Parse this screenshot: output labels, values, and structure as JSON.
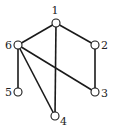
{
  "graph": {
    "nodes": [
      {
        "id": "1",
        "label": "1"
      },
      {
        "id": "2",
        "label": "2"
      },
      {
        "id": "3",
        "label": "3"
      },
      {
        "id": "4",
        "label": "4"
      },
      {
        "id": "5",
        "label": "5"
      },
      {
        "id": "6",
        "label": "6"
      }
    ],
    "edges": [
      {
        "from": "1",
        "to": "6"
      },
      {
        "from": "1",
        "to": "2"
      },
      {
        "from": "1",
        "to": "4"
      },
      {
        "from": "2",
        "to": "3"
      },
      {
        "from": "6",
        "to": "5"
      },
      {
        "from": "6",
        "to": "4"
      },
      {
        "from": "6",
        "to": "3"
      }
    ],
    "colors": {
      "stroke": "#1a1a1a",
      "fill": "#ffffff",
      "text": "#222222"
    }
  }
}
